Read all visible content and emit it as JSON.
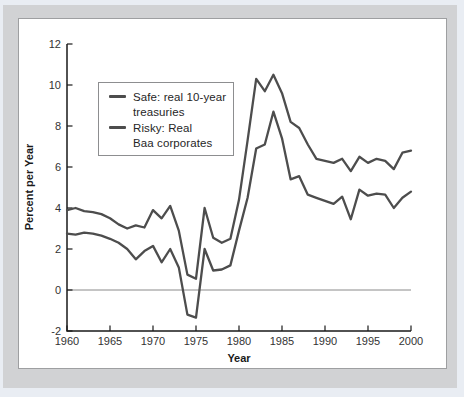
{
  "figure": {
    "ylabel": "Percent per Year",
    "xlabel": "Year"
  },
  "legend": {
    "items": [
      {
        "name": "safe",
        "line1": "Safe: real 10-year",
        "line2": "treasuries"
      },
      {
        "name": "risky",
        "line1": "Risky: Real",
        "line2": "Baa corporates"
      }
    ]
  },
  "chart_data": {
    "type": "line",
    "title": "",
    "xlabel": "Year",
    "ylabel": "Percent per Year",
    "xlim": [
      1960,
      2000
    ],
    "ylim": [
      -2,
      12
    ],
    "xticks": [
      1960,
      1965,
      1970,
      1975,
      1980,
      1985,
      1990,
      1995,
      2000
    ],
    "yticks": [
      -2,
      0,
      2,
      4,
      6,
      8,
      10,
      12
    ],
    "grid": "zero-line-only",
    "legend_position": "upper-left-inside",
    "line_color": "#4d4d4d",
    "axis_color": "#1a1a1a",
    "zero_line_color": "#8a8a8a",
    "x": [
      1960,
      1961,
      1962,
      1963,
      1964,
      1965,
      1966,
      1967,
      1968,
      1969,
      1970,
      1971,
      1972,
      1973,
      1974,
      1975,
      1976,
      1977,
      1978,
      1979,
      1980,
      1981,
      1982,
      1983,
      1984,
      1985,
      1986,
      1987,
      1988,
      1989,
      1990,
      1991,
      1992,
      1993,
      1994,
      1995,
      1996,
      1997,
      1998,
      1999,
      2000
    ],
    "series": [
      {
        "name": "Risky: Real Baa corporates",
        "values": [
          3.9,
          4.0,
          3.85,
          3.8,
          3.7,
          3.5,
          3.2,
          3.0,
          3.15,
          3.05,
          3.9,
          3.5,
          4.1,
          2.9,
          0.75,
          0.55,
          4.0,
          2.55,
          2.3,
          2.5,
          4.4,
          7.3,
          10.3,
          9.7,
          10.5,
          9.6,
          8.2,
          7.9,
          7.1,
          6.4,
          6.3,
          6.2,
          6.4,
          5.8,
          6.5,
          6.2,
          6.4,
          6.3,
          5.9,
          6.7,
          6.8
        ]
      },
      {
        "name": "Safe: real 10-year treasuries",
        "values": [
          2.75,
          2.7,
          2.8,
          2.75,
          2.65,
          2.5,
          2.3,
          2.0,
          1.5,
          1.9,
          2.15,
          1.35,
          2.0,
          1.1,
          -1.2,
          -1.35,
          2.0,
          0.95,
          1.0,
          1.2,
          2.9,
          4.5,
          6.9,
          7.1,
          8.7,
          7.4,
          5.4,
          5.55,
          4.65,
          4.5,
          4.35,
          4.2,
          4.55,
          3.45,
          4.9,
          4.6,
          4.7,
          4.65,
          4.0,
          4.5,
          4.8
        ]
      }
    ]
  }
}
